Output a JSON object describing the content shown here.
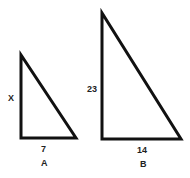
{
  "triangles": [
    {
      "name": "A",
      "side_vertical": "X",
      "side_horizontal": "7"
    },
    {
      "name": "B",
      "side_vertical": "23",
      "side_horizontal": "14"
    }
  ],
  "colors": {
    "stroke": "#111111",
    "background": "#ffffff"
  }
}
